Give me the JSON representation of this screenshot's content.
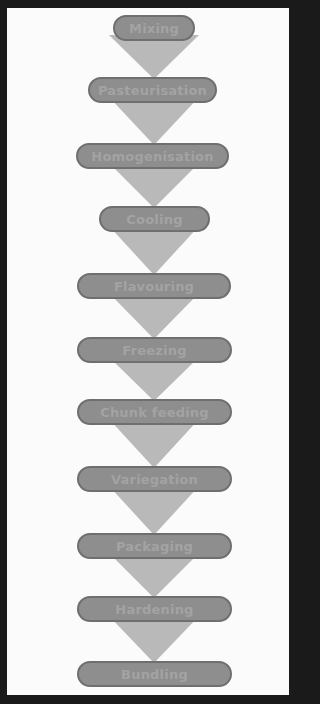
{
  "diagram": {
    "type": "process-flow",
    "steps": [
      {
        "label": "Mixing",
        "x": 113,
        "y": 15,
        "w": 82
      },
      {
        "label": "Pasteurisation",
        "x": 88,
        "y": 77,
        "w": 129
      },
      {
        "label": "Homogenisation",
        "x": 76,
        "y": 143,
        "w": 153
      },
      {
        "label": "Cooling",
        "x": 99,
        "y": 206,
        "w": 111
      },
      {
        "label": "Flavouring",
        "x": 77,
        "y": 273,
        "w": 154
      },
      {
        "label": "Freezing",
        "x": 77,
        "y": 337,
        "w": 155
      },
      {
        "label": "Chunk feeding",
        "x": 77,
        "y": 399,
        "w": 155
      },
      {
        "label": "Variegation",
        "x": 77,
        "y": 466,
        "w": 155
      },
      {
        "label": "Packaging",
        "x": 77,
        "y": 533,
        "w": 155
      },
      {
        "label": "Hardening",
        "x": 77,
        "y": 596,
        "w": 155
      },
      {
        "label": "Bundling",
        "x": 77,
        "y": 661,
        "w": 155
      }
    ],
    "colors": {
      "pill_fill": "#8e8e8e",
      "pill_border": "#6f6f6f",
      "pill_text": "#a3a3a3",
      "arrow": "#b9b9b9",
      "background": "#fbfbfb",
      "frame": "#1a1a1a"
    }
  }
}
